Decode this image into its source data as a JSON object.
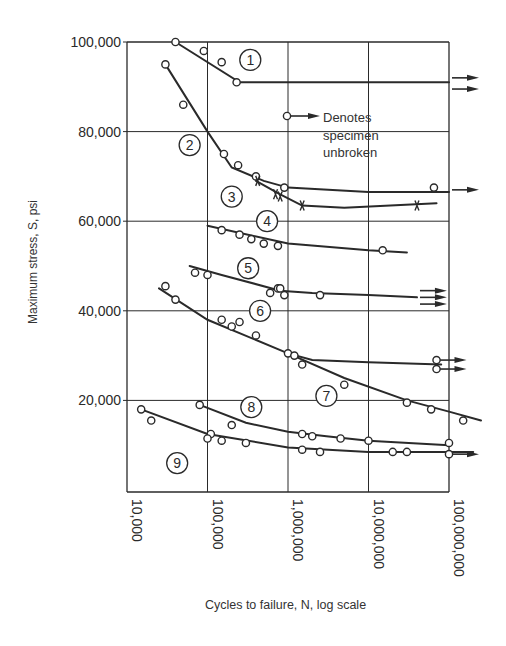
{
  "chart_data": {
    "type": "line",
    "title": "",
    "xlabel": "Cycles to failure, N, log scale",
    "ylabel": "Maximum stress, S, psi",
    "xscale": "log",
    "xlim": [
      10000,
      100000000
    ],
    "ylim": [
      0,
      100000
    ],
    "x_ticks": [
      "10,000",
      "100,000",
      "1,000,000",
      "10,000,000",
      "100,000,000"
    ],
    "y_ticks": [
      "20,000",
      "40,000",
      "60,000",
      "80,000",
      "100,000"
    ],
    "grid": true,
    "legend": {
      "text": [
        "Denotes",
        "specimen",
        "unbroken"
      ],
      "marker": "circle-with-arrow",
      "position": "upper-right-inside"
    },
    "series": [
      {
        "name": "1",
        "marker": "o",
        "curve": [
          [
            40000,
            100000
          ],
          [
            250000,
            91000
          ],
          [
            100000000,
            91000
          ]
        ],
        "points": [
          [
            40000,
            100000
          ],
          [
            90000,
            98000
          ],
          [
            150000,
            95500
          ],
          [
            230000,
            91000
          ]
        ],
        "unbroken": [
          [
            100000000,
            92000
          ],
          [
            100000000,
            89500
          ]
        ],
        "label_at": [
          340000,
          96000
        ]
      },
      {
        "name": "2",
        "marker": "o",
        "curve": [
          [
            30000,
            95000
          ],
          [
            100000,
            80000
          ],
          [
            200000,
            72000
          ],
          [
            500000,
            69000
          ],
          [
            1000000,
            67500
          ],
          [
            10000000,
            66500
          ],
          [
            100000000,
            66500
          ]
        ],
        "points": [
          [
            30000,
            95000
          ],
          [
            50000,
            86000
          ],
          [
            160000,
            75000
          ],
          [
            240000,
            72500
          ],
          [
            400000,
            70000
          ],
          [
            900000,
            67500
          ],
          [
            65000000,
            67500
          ]
        ],
        "unbroken": [
          [
            100000000,
            67000
          ]
        ],
        "label_at": [
          60000,
          77000
        ]
      },
      {
        "name": "3",
        "marker": "x",
        "curve": [
          [
            400000,
            69000
          ],
          [
            800000,
            66000
          ],
          [
            1500000,
            63500
          ],
          [
            5000000,
            63000
          ],
          [
            70000000,
            64000
          ]
        ],
        "points": [
          [
            420000,
            69000
          ],
          [
            700000,
            66000
          ],
          [
            800000,
            65500
          ],
          [
            1500000,
            63500
          ],
          [
            40000000,
            63500
          ]
        ],
        "unbroken": [],
        "label_at": [
          200000,
          65500
        ]
      },
      {
        "name": "4",
        "marker": "o",
        "curve": [
          [
            100000,
            59000
          ],
          [
            1000000,
            55000
          ],
          [
            10000000,
            53500
          ],
          [
            30000000,
            53000
          ]
        ],
        "points": [
          [
            150000,
            58000
          ],
          [
            250000,
            57000
          ],
          [
            350000,
            56000
          ],
          [
            500000,
            55000
          ],
          [
            750000,
            54500
          ],
          [
            15000000,
            53500
          ]
        ],
        "unbroken": [],
        "label_at": [
          550000,
          60000
        ]
      },
      {
        "name": "5",
        "marker": "o",
        "curve": [
          [
            60000,
            50000
          ],
          [
            150000,
            48000
          ],
          [
            800000,
            44500
          ],
          [
            2000000,
            44000
          ],
          [
            10000000,
            43500
          ],
          [
            40000000,
            43000
          ]
        ],
        "points": [
          [
            70000,
            48500
          ],
          [
            100000,
            48000
          ],
          [
            600000,
            44000
          ],
          [
            750000,
            45000
          ],
          [
            800000,
            45000
          ],
          [
            900000,
            43500
          ],
          [
            2500000,
            43500
          ]
        ],
        "unbroken": [
          [
            40000000,
            44500
          ],
          [
            40000000,
            43000
          ],
          [
            40000000,
            41500
          ]
        ],
        "label_at": [
          320000,
          49500
        ]
      },
      {
        "name": "6",
        "marker": "o",
        "curve": [
          [
            25000,
            45000
          ],
          [
            100000,
            38000
          ],
          [
            1000000,
            30500
          ],
          [
            2000000,
            29000
          ],
          [
            10000000,
            28500
          ],
          [
            80000000,
            28000
          ]
        ],
        "points": [
          [
            30000,
            45500
          ],
          [
            40000,
            42500
          ],
          [
            150000,
            38000
          ],
          [
            200000,
            36500
          ],
          [
            250000,
            37500
          ],
          [
            400000,
            34500
          ],
          [
            1000000,
            30500
          ],
          [
            1200000,
            30000
          ],
          [
            70000000,
            29000
          ],
          [
            70000000,
            27000
          ]
        ],
        "unbroken": [
          [
            70000000,
            29000
          ],
          [
            70000000,
            27000
          ]
        ],
        "label_at": [
          450000,
          40000
        ]
      },
      {
        "name": "7",
        "marker": "o",
        "curve": [
          [
            1000000,
            30500
          ],
          [
            5000000,
            25000
          ],
          [
            30000000,
            20000
          ],
          [
            100000000,
            17500
          ],
          [
            250000000,
            15500
          ]
        ],
        "points": [
          [
            1500000,
            28000
          ],
          [
            5000000,
            23500
          ],
          [
            30000000,
            19500
          ],
          [
            60000000,
            18000
          ],
          [
            150000000,
            15500
          ]
        ],
        "unbroken": [],
        "label_at": [
          3000000,
          21000
        ]
      },
      {
        "name": "8",
        "marker": "o",
        "curve": [
          [
            80000,
            19000
          ],
          [
            300000,
            15000
          ],
          [
            1000000,
            13000
          ],
          [
            3000000,
            12000
          ],
          [
            10000000,
            11000
          ],
          [
            100000000,
            10000
          ]
        ],
        "points": [
          [
            80000,
            19000
          ],
          [
            200000,
            14500
          ],
          [
            1500000,
            12500
          ],
          [
            2000000,
            12000
          ],
          [
            4500000,
            11500
          ],
          [
            10000000,
            11000
          ],
          [
            100000000,
            10500
          ]
        ],
        "unbroken": [],
        "label_at": [
          350000,
          18500
        ]
      },
      {
        "name": "9",
        "marker": "o",
        "curve": [
          [
            15000,
            18000
          ],
          [
            100000,
            12500
          ],
          [
            1000000,
            9500
          ],
          [
            10000000,
            8500
          ],
          [
            200000000,
            8500
          ]
        ],
        "points": [
          [
            15000,
            18000
          ],
          [
            20000,
            15500
          ],
          [
            110000,
            12500
          ],
          [
            100000,
            11500
          ],
          [
            150000,
            11000
          ],
          [
            300000,
            10500
          ],
          [
            1500000,
            9000
          ],
          [
            2500000,
            8500
          ],
          [
            20000000,
            8500
          ],
          [
            30000000,
            8500
          ],
          [
            100000000,
            8000
          ]
        ],
        "unbroken": [
          [
            100000000,
            8000
          ]
        ],
        "label_at": [
          42000,
          6000
        ]
      }
    ]
  },
  "figure": {
    "xlabel": "Cycles to failure, N, log scale",
    "ylabel": "Maximum stress, S, psi",
    "legend_lines": [
      "Denotes",
      "specimen",
      "unbroken"
    ]
  }
}
